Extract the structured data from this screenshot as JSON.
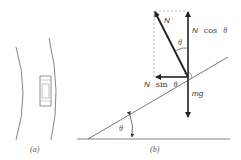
{
  "figure": {
    "panels": [
      {
        "id": "a",
        "label": "(a)",
        "description": "Top view of car on curved road"
      },
      {
        "id": "b",
        "label": "(b)",
        "description": "Force diagram for car on banked curve"
      }
    ],
    "forces": {
      "normal": {
        "label_main": "N"
      },
      "normal_vertical": {
        "label_main": "N",
        "label_fn": "cos",
        "label_var": "θ"
      },
      "normal_horizontal": {
        "label_main": "N",
        "label_fn": "sin",
        "label_var": "θ"
      },
      "weight": {
        "label": "mg"
      }
    },
    "angles": {
      "between_normal_and_vertical": "θ",
      "incline_angle": "θ"
    },
    "colors": {
      "ink": "#222222",
      "dashed": "#999999",
      "thin_line": "#555555"
    }
  }
}
